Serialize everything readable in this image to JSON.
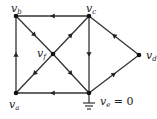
{
  "diagram": {
    "type": "directed-circuit-graph",
    "nodes": [
      {
        "id": "vb",
        "label": "v",
        "sub": "b",
        "x": 16,
        "y": 16
      },
      {
        "id": "vc",
        "label": "v",
        "sub": "c",
        "x": 89,
        "y": 16
      },
      {
        "id": "vf",
        "label": "v",
        "sub": "f",
        "x": 53,
        "y": 54
      },
      {
        "id": "vd",
        "label": "v",
        "sub": "d",
        "x": 139,
        "y": 55
      },
      {
        "id": "va",
        "label": "v",
        "sub": "a",
        "x": 16,
        "y": 93
      },
      {
        "id": "ve",
        "label": "v",
        "sub": "e",
        "suffix": " = 0",
        "x": 89,
        "y": 93
      }
    ],
    "edges": [
      {
        "from": "vc",
        "to": "vb"
      },
      {
        "from": "va",
        "to": "vb"
      },
      {
        "from": "vb",
        "to": "vf"
      },
      {
        "from": "vf",
        "to": "vc"
      },
      {
        "from": "vf",
        "to": "va"
      },
      {
        "from": "vf",
        "to": "ve"
      },
      {
        "from": "vc",
        "to": "ve"
      },
      {
        "from": "ve",
        "to": "va"
      },
      {
        "from": "vd",
        "to": "vc"
      },
      {
        "from": "ve",
        "to": "vd"
      }
    ],
    "ground_node": "ve",
    "ground_label": "0",
    "colors": {
      "line": "#333333",
      "node": "#111111"
    }
  }
}
